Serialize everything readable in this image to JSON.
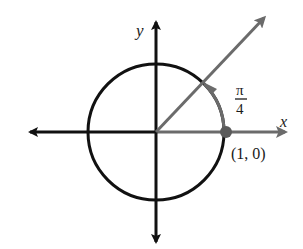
{
  "diagram": {
    "labels": {
      "y_axis": "y",
      "x_axis": "x",
      "angle_numerator": "π",
      "angle_denominator": "4",
      "point": "(1, 0)"
    },
    "colors": {
      "axis_black": "#111111",
      "ray_gray": "#6b6b6b",
      "circle_black": "#111111",
      "point_gray": "#5a5a5a"
    },
    "geometry": {
      "center": [
        156,
        132
      ],
      "radius": 68,
      "angle_radians": "π/4"
    }
  }
}
